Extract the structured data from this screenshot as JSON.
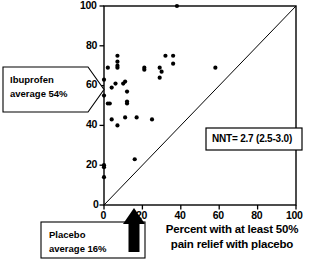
{
  "figure": {
    "name": "ibuprofen-vs-placebo-lab-plot",
    "background_color": "#ffffff",
    "ink_color": "#000000"
  },
  "chart_data": {
    "type": "scatter",
    "title": "",
    "xlabel": "Percent with at least 50% pain relief with placebo",
    "ylabel": "",
    "xlim": [
      0,
      100
    ],
    "ylim": [
      0,
      100
    ],
    "xticks": [
      0,
      20,
      40,
      60,
      80,
      100
    ],
    "yticks": [
      0,
      20,
      40,
      60,
      80,
      100
    ],
    "xtick_labels": [
      "0",
      "20",
      "40",
      "60",
      "80",
      "100"
    ],
    "ytick_labels": [
      "0",
      "20",
      "40",
      "60",
      "80",
      "100"
    ],
    "grid": false,
    "legend": "none",
    "reference_line": {
      "name": "line-of-equality",
      "from": [
        0,
        0
      ],
      "to": [
        100,
        100
      ],
      "style": "solid-thin"
    },
    "marker": {
      "shape": "circle",
      "color": "#000000",
      "size_px": 4.2
    },
    "series": [
      {
        "name": "trials",
        "points": [
          [
            38,
            100
          ],
          [
            7,
            75
          ],
          [
            7,
            72
          ],
          [
            36,
            75
          ],
          [
            32,
            75
          ],
          [
            7,
            70
          ],
          [
            7,
            69
          ],
          [
            36,
            71
          ],
          [
            21,
            69
          ],
          [
            21,
            68
          ],
          [
            2,
            69
          ],
          [
            29,
            69
          ],
          [
            58,
            69
          ],
          [
            30,
            67
          ],
          [
            0,
            63
          ],
          [
            6,
            61
          ],
          [
            10,
            61
          ],
          [
            29,
            64
          ],
          [
            11,
            62
          ],
          [
            4,
            59
          ],
          [
            0,
            55
          ],
          [
            12,
            57
          ],
          [
            2,
            51
          ],
          [
            3,
            51
          ],
          [
            12,
            52
          ],
          [
            12,
            51
          ],
          [
            4,
            43
          ],
          [
            11,
            44
          ],
          [
            17,
            44
          ],
          [
            25,
            43
          ],
          [
            7,
            40
          ],
          [
            16,
            23
          ],
          [
            0,
            20
          ],
          [
            0,
            19
          ],
          [
            0,
            14
          ]
        ]
      }
    ],
    "annotations": [
      {
        "name": "ibuprofen-average-callout",
        "text_lines": [
          "Ibuprofen",
          "average 54%"
        ],
        "points_to_axis": "y",
        "points_to_value": 54,
        "shape": "arrow-pentagon-right"
      },
      {
        "name": "placebo-average-callout",
        "text_lines": [
          "Placebo",
          "average 16%"
        ],
        "points_to_axis": "x",
        "points_to_value": 16,
        "shape": "rect-with-up-arrow"
      },
      {
        "name": "nnt-box",
        "text": "NNT= 2.7 (2.5-3.0)",
        "shape": "rect"
      }
    ]
  },
  "labels": {
    "y_ticks": [
      "100",
      "80",
      "60",
      "40",
      "20",
      "0"
    ],
    "x_ticks": [
      "0",
      "20",
      "40",
      "60",
      "80",
      "100"
    ],
    "ibuprofen_line1": "Ibuprofen",
    "ibuprofen_line2": "average 54%",
    "placebo_line1": "Placebo",
    "placebo_line2": "average 16%",
    "nnt": "NNT= 2.7 (2.5-3.0)",
    "xaxis_line1": "Percent with at least 50%",
    "xaxis_line2": "pain relief with placebo"
  }
}
